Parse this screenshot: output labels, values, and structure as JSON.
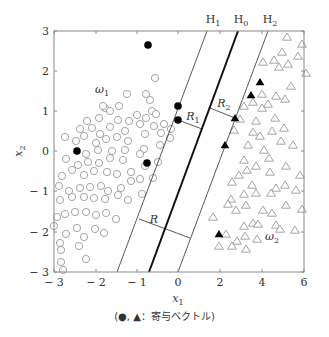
{
  "chart_data": {
    "type": "scatter",
    "title": "",
    "xlabel": "x1",
    "ylabel": "x2",
    "xlim": [
      -3,
      6
    ],
    "ylim": [
      -3,
      3
    ],
    "x_ticks": [
      "-3",
      "-2",
      "-1",
      "0",
      "2",
      "4",
      "6"
    ],
    "y_ticks": [
      "3",
      "2",
      "1",
      "0",
      "-1",
      "-2",
      "-3"
    ],
    "grid": false,
    "lines": [
      {
        "name": "H1",
        "style": "thin"
      },
      {
        "name": "H0",
        "style": "thick"
      },
      {
        "name": "H2",
        "style": "thin"
      }
    ],
    "margins": [
      "R1",
      "R2",
      "R"
    ],
    "series": [
      {
        "name": "omega1",
        "label": "ω1",
        "marker": "open-circle"
      },
      {
        "name": "omega1-support",
        "marker": "filled-circle"
      },
      {
        "name": "omega2",
        "label": "ω2",
        "marker": "open-triangle"
      },
      {
        "name": "omega2-support",
        "marker": "filled-triangle"
      }
    ],
    "annotations": [
      "H1",
      "H0",
      "H2",
      "R1",
      "R2",
      "R",
      "ω1",
      "ω2"
    ],
    "caption": "(●, ▲：寄与ベクトル)"
  },
  "axes": {
    "xlabel": "x",
    "xlabel_sub": "1",
    "ylabel": "x",
    "ylabel_sub": "2",
    "x_ticks": [
      {
        "label": "− 3",
        "px": 54
      },
      {
        "label": "− 2",
        "px": 96
      },
      {
        "label": "− 1",
        "px": 137
      },
      {
        "label": "0",
        "px": 178
      },
      {
        "label": "2",
        "px": 220
      },
      {
        "label": "4",
        "px": 262
      },
      {
        "label": "6",
        "px": 304
      }
    ],
    "y_ticks": [
      {
        "label": "3",
        "py": 31
      },
      {
        "label": "2",
        "py": 71
      },
      {
        "label": "1",
        "py": 111
      },
      {
        "label": "0",
        "py": 151
      },
      {
        "label": "− 1",
        "py": 191
      },
      {
        "label": "− 2",
        "py": 232
      },
      {
        "label": "− 3",
        "py": 272
      }
    ]
  },
  "labels": {
    "H1": "H",
    "H1_sub": "1",
    "H0": "H",
    "H0_sub": "0",
    "H2": "H",
    "H2_sub": "2",
    "R1": "R",
    "R1_sub": "1",
    "R2": "R",
    "R2_sub": "2",
    "R": "R",
    "omega1": "ω",
    "omega1_sub": "1",
    "omega2": "ω",
    "omega2_sub": "2"
  },
  "caption": "(●, ▲：寄与ベクトル)",
  "colors": {
    "ink": "#111111",
    "axis": "#888888",
    "marker": "#9a9a9a",
    "support": "#000000"
  },
  "points": {
    "open_circles": [
      [
        155,
        78
      ],
      [
        146,
        94
      ],
      [
        150,
        100
      ],
      [
        127,
        94
      ],
      [
        119,
        106
      ],
      [
        105,
        108
      ],
      [
        103,
        106
      ],
      [
        110,
        111
      ],
      [
        152,
        111
      ],
      [
        137,
        115
      ],
      [
        146,
        118
      ],
      [
        156,
        114
      ],
      [
        129,
        121
      ],
      [
        118,
        120
      ],
      [
        99,
        118
      ],
      [
        87,
        121
      ],
      [
        80,
        129
      ],
      [
        92,
        128
      ],
      [
        100,
        134
      ],
      [
        110,
        127
      ],
      [
        125,
        131
      ],
      [
        140,
        124
      ],
      [
        154,
        126
      ],
      [
        164,
        124
      ],
      [
        65,
        137
      ],
      [
        76,
        141
      ],
      [
        84,
        136
      ],
      [
        96,
        143
      ],
      [
        106,
        139
      ],
      [
        117,
        137
      ],
      [
        128,
        141
      ],
      [
        145,
        134
      ],
      [
        161,
        133
      ],
      [
        171,
        129
      ],
      [
        170,
        138
      ],
      [
        160,
        145
      ],
      [
        144,
        149
      ],
      [
        125,
        150
      ],
      [
        112,
        151
      ],
      [
        98,
        150
      ],
      [
        86,
        154
      ],
      [
        66,
        159
      ],
      [
        78,
        165
      ],
      [
        88,
        162
      ],
      [
        99,
        163
      ],
      [
        110,
        158
      ],
      [
        123,
        160
      ],
      [
        140,
        154
      ],
      [
        62,
        176
      ],
      [
        72,
        170
      ],
      [
        84,
        175
      ],
      [
        94,
        171
      ],
      [
        107,
        172
      ],
      [
        117,
        174
      ],
      [
        131,
        172
      ],
      [
        145,
        166
      ],
      [
        158,
        162
      ],
      [
        59,
        186
      ],
      [
        69,
        191
      ],
      [
        80,
        188
      ],
      [
        90,
        187
      ],
      [
        101,
        186
      ],
      [
        108,
        191
      ],
      [
        121,
        188
      ],
      [
        131,
        181
      ],
      [
        140,
        179
      ],
      [
        153,
        178
      ],
      [
        60,
        200
      ],
      [
        72,
        197
      ],
      [
        84,
        197
      ],
      [
        94,
        198
      ],
      [
        105,
        199
      ],
      [
        118,
        195
      ],
      [
        128,
        200
      ],
      [
        142,
        194
      ],
      [
        57,
        217
      ],
      [
        65,
        214
      ],
      [
        75,
        212
      ],
      [
        86,
        212
      ],
      [
        96,
        215
      ],
      [
        106,
        213
      ],
      [
        116,
        219
      ],
      [
        54,
        226
      ],
      [
        66,
        234
      ],
      [
        77,
        228
      ],
      [
        84,
        237
      ],
      [
        95,
        229
      ],
      [
        104,
        233
      ],
      [
        60,
        243
      ],
      [
        61,
        250
      ],
      [
        79,
        246
      ],
      [
        86,
        259
      ],
      [
        61,
        262
      ],
      [
        63,
        270
      ]
    ],
    "filled_circles": [
      [
        77,
        151
      ],
      [
        148,
        45
      ],
      [
        178,
        106
      ],
      [
        178,
        120
      ],
      [
        147,
        163
      ]
    ],
    "open_triangles": [
      [
        287,
        37
      ],
      [
        302,
        44
      ],
      [
        282,
        52
      ],
      [
        298,
        56
      ],
      [
        274,
        60
      ],
      [
        288,
        64
      ],
      [
        263,
        62
      ],
      [
        306,
        73
      ],
      [
        279,
        67
      ],
      [
        276,
        96
      ],
      [
        291,
        86
      ],
      [
        262,
        94
      ],
      [
        253,
        102
      ],
      [
        285,
        99
      ],
      [
        268,
        104
      ],
      [
        244,
        106
      ],
      [
        262,
        108
      ],
      [
        240,
        119
      ],
      [
        275,
        118
      ],
      [
        256,
        121
      ],
      [
        284,
        128
      ],
      [
        253,
        132
      ],
      [
        272,
        131
      ],
      [
        234,
        130
      ],
      [
        260,
        136
      ],
      [
        281,
        141
      ],
      [
        248,
        145
      ],
      [
        293,
        145
      ],
      [
        264,
        150
      ],
      [
        244,
        160
      ],
      [
        269,
        158
      ],
      [
        286,
        166
      ],
      [
        256,
        166
      ],
      [
        239,
        175
      ],
      [
        270,
        172
      ],
      [
        232,
        182
      ],
      [
        247,
        170
      ],
      [
        276,
        188
      ],
      [
        300,
        175
      ],
      [
        252,
        185
      ],
      [
        231,
        199
      ],
      [
        285,
        185
      ],
      [
        256,
        193
      ],
      [
        271,
        193
      ],
      [
        244,
        194
      ],
      [
        228,
        204
      ],
      [
        296,
        190
      ],
      [
        286,
        205
      ],
      [
        246,
        205
      ],
      [
        263,
        210
      ],
      [
        302,
        209
      ],
      [
        236,
        210
      ],
      [
        272,
        213
      ],
      [
        253,
        223
      ],
      [
        276,
        225
      ],
      [
        244,
        226
      ],
      [
        213,
        217
      ],
      [
        280,
        229
      ],
      [
        245,
        236
      ],
      [
        226,
        234
      ],
      [
        237,
        241
      ],
      [
        258,
        224
      ],
      [
        295,
        230
      ],
      [
        232,
        246
      ],
      [
        257,
        239
      ],
      [
        219,
        246
      ],
      [
        246,
        249
      ]
    ],
    "filled_triangles": [
      [
        260,
        82
      ],
      [
        251,
        95
      ],
      [
        235,
        118
      ],
      [
        225,
        145
      ],
      [
        219,
        234
      ]
    ]
  },
  "geometry": {
    "plot": {
      "x0": 54,
      "y0": 31,
      "x1": 304,
      "y1": 272
    },
    "H0": {
      "x_top": 238,
      "x_bot": 149
    },
    "H1": {
      "x_top": 207,
      "x_bot": 117
    },
    "H2": {
      "x_top": 268,
      "x_bot": 178
    },
    "R1": {
      "x1": 178,
      "y1": 120,
      "x2": 202,
      "y2": 129
    },
    "R2": {
      "x1": 210,
      "y1": 108,
      "x2": 235,
      "y2": 118
    },
    "R": {
      "x1": 139,
      "y1": 219,
      "x2": 190,
      "y2": 238
    }
  }
}
